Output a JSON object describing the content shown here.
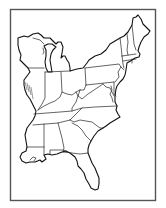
{
  "map": {
    "title": "",
    "region": "Eastern United States",
    "style": "outline",
    "colors": {
      "background": "#ffffff",
      "line": "#111111",
      "frame": "#555555"
    },
    "labels": [],
    "states_depicted": [
      "Wisconsin",
      "Michigan",
      "Illinois",
      "Indiana",
      "Ohio",
      "Kentucky",
      "Tennessee",
      "Mississippi",
      "Alabama",
      "Georgia",
      "Florida",
      "South Carolina",
      "North Carolina",
      "Virginia",
      "West Virginia",
      "Maryland",
      "Delaware",
      "New Jersey",
      "Pennsylvania",
      "New York",
      "Connecticut",
      "Rhode Island",
      "Massachusetts",
      "Vermont",
      "New Hampshire",
      "Maine"
    ]
  }
}
